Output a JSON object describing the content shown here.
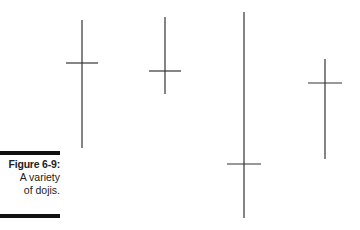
{
  "caption": {
    "figure_label": "Figure 6-9:",
    "line1": "A variety",
    "line2": "of dojis."
  },
  "chart_data": {
    "type": "candlestick-doji",
    "title": "",
    "dojis": [
      {
        "name": "doji-1",
        "x": 82,
        "high_y": 20,
        "low_y": 148,
        "open_close_y": 63,
        "tick_half_width": 16
      },
      {
        "name": "doji-2",
        "x": 165,
        "high_y": 17,
        "low_y": 94,
        "open_close_y": 71,
        "tick_half_width": 16
      },
      {
        "name": "doji-3",
        "x": 244,
        "high_y": 12,
        "low_y": 218,
        "open_close_y": 164,
        "tick_half_width": 17
      },
      {
        "name": "doji-4",
        "x": 325,
        "high_y": 59,
        "low_y": 159,
        "open_close_y": 83,
        "tick_half_width": 17
      }
    ],
    "colors": {
      "line": "#333333",
      "background": "#ffffff"
    }
  }
}
